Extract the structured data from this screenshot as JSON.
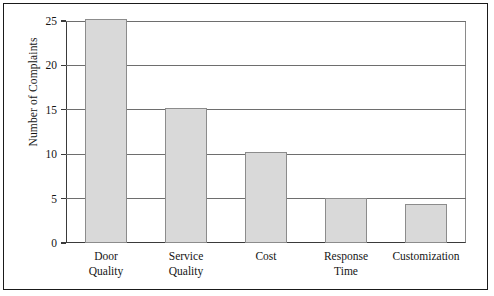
{
  "figure": {
    "background_color": "#ffffff",
    "frame_color": "#1a1a1a",
    "bar_fill_color": "#d9d9d9",
    "bar_edge_color": "#8c8c8c",
    "gridline_color": "#6e6e6e",
    "axis_color": "#3a3a3a"
  },
  "chart_data": {
    "type": "bar",
    "title": "",
    "subtitle": "",
    "xlabel": "",
    "ylabel": "Number of Complaints",
    "categories": [
      "Door\nQuality",
      "Service\nQuality",
      "Cost",
      "Response\nTime",
      "Customization"
    ],
    "values": [
      25.2,
      15.2,
      10.3,
      5.1,
      4.4
    ],
    "ylim": [
      0,
      25
    ],
    "xlim": [
      0,
      5
    ],
    "yticks": [
      0,
      5,
      10,
      15,
      20,
      25
    ],
    "ytick_labels": [
      "0",
      "5",
      "10",
      "15",
      "20",
      "25"
    ],
    "grid": true,
    "grid_axis": "y",
    "legend": null,
    "legend_position": "none",
    "annotations": []
  }
}
